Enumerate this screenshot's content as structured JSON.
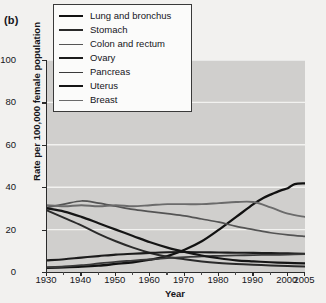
{
  "panel_label": "(b)",
  "legend": {
    "items": [
      {
        "label": "Lung and bronchus",
        "color": "#111111",
        "width": 2.3
      },
      {
        "label": "Stomach",
        "color": "#2a2a2a",
        "width": 2.0
      },
      {
        "label": "Colon and rectum",
        "color": "#545454",
        "width": 1.7
      },
      {
        "label": "Ovary",
        "color": "#1c1c1c",
        "width": 2.1
      },
      {
        "label": "Pancreas",
        "color": "#3a3a3a",
        "width": 1.8
      },
      {
        "label": "Uterus",
        "color": "#151515",
        "width": 2.2
      },
      {
        "label": "Breast",
        "color": "#6b6b6b",
        "width": 1.9
      }
    ]
  },
  "chart_data": {
    "type": "line",
    "title": "",
    "subtitle": "",
    "xlabel": "Year",
    "ylabel": "Rate per 100,000 female population",
    "xlim": [
      1930,
      2005
    ],
    "ylim": [
      0,
      100
    ],
    "grid": true,
    "grid_color": "#f2f2f0",
    "plot_background": "#d0cfcd",
    "legend_position": "top-left",
    "xticks": [
      1930,
      1940,
      1950,
      1960,
      1970,
      1980,
      1990,
      2000,
      2005
    ],
    "xticklabels": [
      "1930",
      "1940",
      "1950",
      "1960",
      "1970",
      "1980",
      "1990",
      "2000",
      "2005"
    ],
    "yticks": [
      0,
      20,
      40,
      60,
      80,
      100
    ],
    "yticklabels": [
      "0",
      "20",
      "40",
      "60",
      "80",
      "100"
    ],
    "series": [
      {
        "name": "Lung and bronchus",
        "color": "#111111",
        "x": [
          1930,
          1935,
          1940,
          1945,
          1950,
          1955,
          1960,
          1965,
          1970,
          1975,
          1980,
          1985,
          1990,
          1993,
          1995,
          1998,
          2000,
          2002,
          2005
        ],
        "values": [
          2.0,
          2.2,
          2.5,
          3.0,
          3.8,
          4.6,
          5.8,
          7.5,
          10.5,
          14.5,
          20.0,
          26.0,
          32.0,
          35.0,
          36.5,
          38.5,
          39.5,
          41.5,
          41.8
        ]
      },
      {
        "name": "Stomach",
        "color": "#2a2a2a",
        "x": [
          1930,
          1935,
          1940,
          1945,
          1950,
          1955,
          1960,
          1965,
          1970,
          1975,
          1980,
          1985,
          1990,
          1995,
          2000,
          2005
        ],
        "values": [
          29.0,
          25.5,
          22.0,
          18.0,
          14.5,
          11.5,
          9.0,
          7.2,
          6.0,
          5.0,
          4.3,
          3.8,
          3.4,
          3.1,
          2.8,
          2.6
        ]
      },
      {
        "name": "Colon and rectum",
        "color": "#545454",
        "x": [
          1930,
          1935,
          1940,
          1945,
          1950,
          1955,
          1960,
          1965,
          1970,
          1975,
          1980,
          1985,
          1990,
          1995,
          2000,
          2005
        ],
        "values": [
          30.5,
          32.0,
          33.5,
          32.5,
          31.0,
          29.5,
          28.5,
          27.5,
          26.5,
          25.0,
          23.5,
          21.5,
          20.0,
          18.5,
          17.5,
          16.8
        ]
      },
      {
        "name": "Ovary",
        "color": "#1c1c1c",
        "x": [
          1930,
          1935,
          1940,
          1945,
          1950,
          1955,
          1960,
          1965,
          1970,
          1975,
          1980,
          1985,
          1990,
          1995,
          2000,
          2005
        ],
        "values": [
          5.5,
          6.0,
          6.8,
          7.5,
          8.2,
          8.6,
          9.0,
          9.3,
          9.4,
          9.3,
          9.2,
          9.1,
          9.0,
          8.9,
          8.8,
          8.6
        ]
      },
      {
        "name": "Pancreas",
        "color": "#3a3a3a",
        "x": [
          1930,
          1935,
          1940,
          1945,
          1950,
          1955,
          1960,
          1965,
          1970,
          1975,
          1980,
          1985,
          1990,
          1995,
          2000,
          2005
        ],
        "values": [
          2.2,
          2.6,
          3.2,
          4.0,
          4.8,
          5.4,
          6.0,
          6.5,
          7.0,
          7.4,
          7.6,
          7.8,
          8.0,
          8.1,
          8.2,
          8.4
        ]
      },
      {
        "name": "Uterus",
        "color": "#151515",
        "x": [
          1930,
          1935,
          1940,
          1945,
          1950,
          1955,
          1960,
          1965,
          1970,
          1975,
          1980,
          1985,
          1990,
          1995,
          2000,
          2005
        ],
        "values": [
          30.0,
          28.5,
          26.0,
          23.0,
          20.0,
          17.0,
          14.0,
          11.5,
          9.5,
          7.8,
          6.5,
          5.5,
          5.0,
          4.6,
          4.3,
          4.1
        ]
      },
      {
        "name": "Breast",
        "color": "#6b6b6b",
        "x": [
          1930,
          1935,
          1940,
          1945,
          1950,
          1955,
          1960,
          1965,
          1970,
          1975,
          1980,
          1985,
          1990,
          1995,
          2000,
          2005
        ],
        "values": [
          31.5,
          31.0,
          31.5,
          31.0,
          31.5,
          31.0,
          31.5,
          32.0,
          32.0,
          32.0,
          32.5,
          33.0,
          33.0,
          30.5,
          27.5,
          26.0
        ]
      }
    ]
  }
}
